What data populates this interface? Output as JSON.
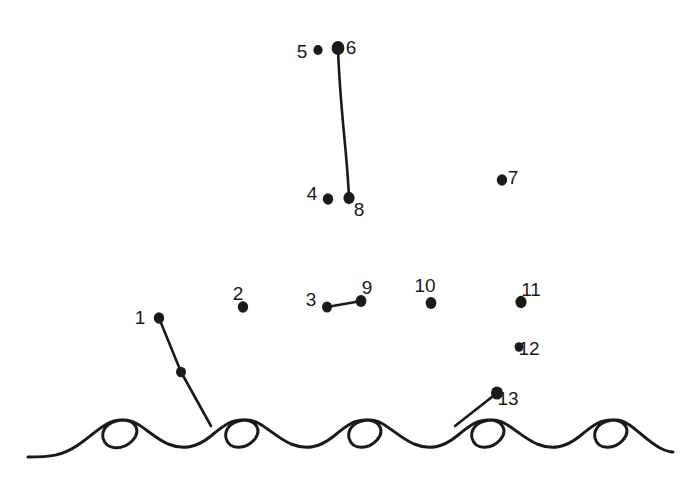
{
  "page": {
    "background_color": "#ffffff",
    "ink_color": "#1a1a1a",
    "width": 693,
    "height": 493
  },
  "dots": [
    {
      "number": "1",
      "x": 159,
      "y": 318,
      "r": 5.2,
      "label_x": 140,
      "label_y": 324
    },
    {
      "number": "2",
      "x": 243,
      "y": 307,
      "r": 5.2,
      "label_x": 238,
      "label_y": 300
    },
    {
      "number": "3",
      "x": 327,
      "y": 307,
      "r": 5.0,
      "label_x": 311,
      "label_y": 306
    },
    {
      "number": "4",
      "x": 328,
      "y": 199,
      "r": 5.2,
      "label_x": 312,
      "label_y": 200
    },
    {
      "number": "5",
      "x": 318,
      "y": 50,
      "r": 4.6,
      "label_x": 302,
      "label_y": 58
    },
    {
      "number": "6",
      "x": 338,
      "y": 48,
      "r": 6.4,
      "label_x": 351,
      "label_y": 54
    },
    {
      "number": "7",
      "x": 502,
      "y": 180,
      "r": 5.2,
      "label_x": 513,
      "label_y": 184
    },
    {
      "number": "8",
      "x": 349,
      "y": 198,
      "r": 5.6,
      "label_x": 359,
      "label_y": 216
    },
    {
      "number": "9",
      "x": 361,
      "y": 301,
      "r": 5.4,
      "label_x": 367,
      "label_y": 294
    },
    {
      "number": "10",
      "x": 431,
      "y": 303,
      "r": 5.4,
      "label_x": 425,
      "label_y": 292
    },
    {
      "number": "11",
      "x": 521,
      "y": 302,
      "r": 5.6,
      "label_x": 531,
      "label_y": 296
    },
    {
      "number": "12",
      "x": 519,
      "y": 347,
      "r": 4.4,
      "label_x": 529,
      "label_y": 355
    },
    {
      "number": "13",
      "x": 497,
      "y": 393,
      "r": 6.0,
      "label_x": 508,
      "label_y": 405
    }
  ],
  "extra_dots": [
    {
      "name": "mast-midpoint-dot",
      "x": 181,
      "y": 372,
      "r": 5.0
    }
  ],
  "drawn_strokes": [
    {
      "name": "mast-line",
      "description": "line from dot 1 down through an unnumbered dot to a wave crest",
      "path": "M159,318 L181,372 L211,426"
    },
    {
      "name": "sail-edge-line",
      "description": "long slightly curved line from dot 6 down to dot 8",
      "path": "M338,48 C340,110 347,150 349,198"
    },
    {
      "name": "boom-line",
      "description": "short line connecting dot 3 to dot 9",
      "path": "M327,307 L361,301"
    },
    {
      "name": "stay-line",
      "description": "line from dot 13 down-left into a wave crest",
      "path": "M497,393 L455,426"
    }
  ],
  "waves": {
    "name": "ocean-wave-line",
    "count": 9,
    "stroke_width": 3,
    "path": "M28,457 C50,457 62,456 78,445 C96,433 105,420 122,420 C137,420 141,432 132,441 C122,451 106,450 103,438 C101,427 112,420 124,420 C139,420 150,436 168,444 C183,450 196,448 211,436 C224,425 232,419 245,420 C257,421 262,431 254,440 C245,450 229,450 226,438 C224,427 234,420 247,420 C261,420 273,436 291,444 C306,450 319,448 334,436 C347,425 355,419 368,420 C380,421 385,431 377,440 C368,450 352,450 349,438 C347,427 357,420 370,420 C384,420 396,436 414,444 C429,450 442,448 457,436 C470,425 478,419 491,420 C503,421 508,431 500,440 C491,450 475,450 472,438 C470,427 480,420 493,420 C507,420 519,436 537,444 C552,450 565,448 580,436 C593,425 601,419 614,420 C626,421 631,431 623,440 C614,450 598,450 595,438 C593,427 603,420 616,420 C630,420 642,438 660,448 C666,451 670,452 673,452"
  }
}
